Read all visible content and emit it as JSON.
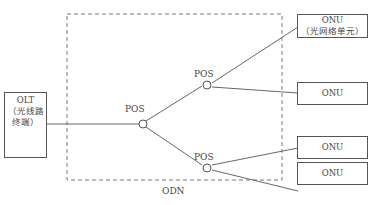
{
  "diagram": {
    "region_label": "ODN",
    "olt": {
      "line1": "OLT",
      "line2": "（光线路",
      "line3": "终端）"
    },
    "splitters": [
      {
        "label": "POS"
      },
      {
        "label": "POS"
      },
      {
        "label": "POS"
      }
    ],
    "onus": [
      {
        "line1": "ONU",
        "line2": "（光网络单元）"
      },
      {
        "line1": "ONU"
      },
      {
        "line1": "ONU"
      },
      {
        "line1": "ONU"
      }
    ],
    "colors": {
      "line": "#666666",
      "box_border": "#555555",
      "dash": "#777777",
      "text": "#444444"
    }
  }
}
